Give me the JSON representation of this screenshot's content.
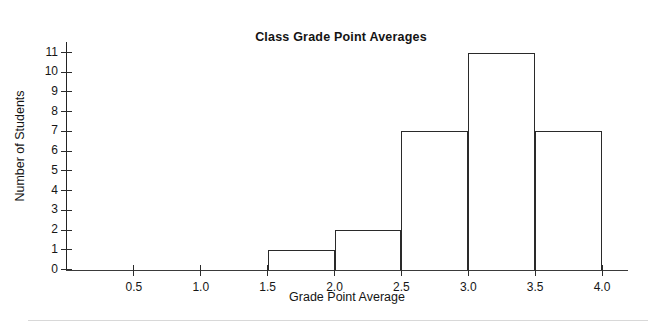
{
  "chart_data": {
    "type": "bar",
    "title": "Class Grade Point Averages",
    "xlabel": "Grade Point Average",
    "ylabel": "Number of Students",
    "bin_width": 0.5,
    "bin_edges": [
      0.0,
      0.5,
      1.0,
      1.5,
      2.0,
      2.5,
      3.0,
      3.5,
      4.0
    ],
    "categories": [
      "0.0-0.5",
      "0.5-1.0",
      "1.0-1.5",
      "1.5-2.0",
      "2.0-2.5",
      "2.5-3.0",
      "3.0-3.5",
      "3.5-4.0"
    ],
    "values": [
      0,
      0,
      0,
      1,
      2,
      7,
      11,
      7
    ],
    "bars": [
      {
        "label": "1.5-2.0",
        "x0": 1.5,
        "x1": 2.0,
        "value": 1
      },
      {
        "label": "2.0-2.5",
        "x0": 2.0,
        "x1": 2.5,
        "value": 2
      },
      {
        "label": "2.5-3.0",
        "x0": 2.5,
        "x1": 3.0,
        "value": 7
      },
      {
        "label": "3.0-3.5",
        "x0": 3.0,
        "x1": 3.5,
        "value": 11
      },
      {
        "label": "3.5-4.0",
        "x0": 3.5,
        "x1": 4.0,
        "value": 7
      }
    ],
    "xlim": [
      0.0,
      4.2
    ],
    "ylim": [
      0,
      11
    ],
    "xticks": [
      0.5,
      1.0,
      1.5,
      2.0,
      2.5,
      3.0,
      3.5,
      4.0
    ],
    "xtick_labels": [
      "0.5",
      "1.0",
      "1.5",
      "2.0",
      "2.5",
      "3.0",
      "3.5",
      "4.0"
    ],
    "yticks": [
      0,
      1,
      2,
      3,
      4,
      5,
      6,
      7,
      8,
      9,
      10,
      11
    ],
    "ytick_labels": [
      "0",
      "1",
      "2",
      "3",
      "4",
      "5",
      "6",
      "7",
      "8",
      "9",
      "10",
      "11"
    ],
    "grid": false,
    "legend": null,
    "bar_fill_color": "#ffffff",
    "bar_edge_color": "#2a2a2a",
    "background_color": "#ffffff",
    "text_color": "#141414",
    "total_students": 28
  }
}
